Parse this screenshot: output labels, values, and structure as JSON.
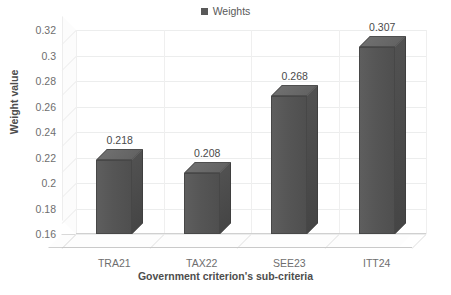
{
  "chart_data": {
    "type": "bar",
    "title": "",
    "subtitle": "",
    "categories": [
      "TRA21",
      "TAX22",
      "SEE23",
      "ITT24"
    ],
    "values": [
      0.218,
      0.208,
      0.268,
      0.307
    ],
    "value_labels": [
      "0.218",
      "0.208",
      "0.268",
      "0.307"
    ],
    "series": [
      {
        "name": "Weights",
        "values": [
          0.218,
          0.208,
          0.268,
          0.307
        ]
      }
    ],
    "xlabel": "Government criterion's sub-criteria",
    "ylabel": "Weight value",
    "ylim": [
      0.16,
      0.32
    ],
    "ytick_step": 0.02,
    "ytick_labels": [
      "0.32",
      "0.3",
      "0.28",
      "0.26",
      "0.24",
      "0.22",
      "0.2",
      "0.18",
      "0.16"
    ],
    "ytick_values": [
      0.32,
      0.3,
      0.28,
      0.26,
      0.24,
      0.22,
      0.2,
      0.18,
      0.16
    ],
    "grid": true,
    "grid_axis": "both",
    "legend": {
      "position": "top",
      "entries": [
        "Weights"
      ]
    },
    "style": "3d-column",
    "colors": {
      "bar_front": "#585858",
      "bar_side": "#4a4a4a",
      "bar_top": "#6a6a6a",
      "legend_swatch": "#595959",
      "gridline": "#eceded",
      "tick_text": "#6e6e6e",
      "axis_title": "#4d4d4d",
      "data_label": "#4a4a4a",
      "plot_background": "#ffffff"
    }
  },
  "legend": {
    "swatch_name": "legend-swatch-weights",
    "label": "Weights"
  },
  "axes": {
    "y_title": "Weight value",
    "x_title": "Government criterion's sub-criteria"
  }
}
